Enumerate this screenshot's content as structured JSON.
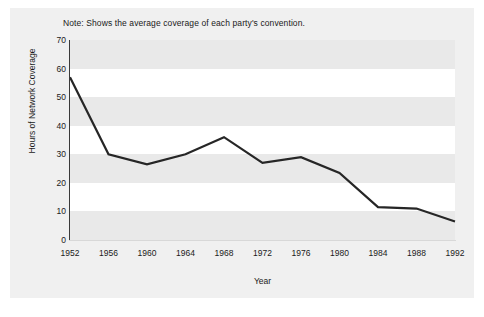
{
  "chart_data": {
    "type": "line",
    "title": "",
    "subtitle": "",
    "note": "Note: Shows the average coverage of each party's convention.",
    "xlabel": "Year",
    "ylabel": "Hours of Network Coverage",
    "x": [
      1952,
      1956,
      1960,
      1964,
      1968,
      1972,
      1976,
      1980,
      1984,
      1988,
      1992
    ],
    "xtick_labels": [
      "1952",
      "1956",
      "1960",
      "1964",
      "1968",
      "1972",
      "1976",
      "1980",
      "1984",
      "1988",
      "1992"
    ],
    "ytick_labels": [
      "0",
      "10",
      "20",
      "30",
      "40",
      "50",
      "60",
      "70"
    ],
    "yticks": [
      0,
      10,
      20,
      30,
      40,
      50,
      60,
      70
    ],
    "ylim": [
      0,
      70
    ],
    "xlim": [
      1952,
      1992
    ],
    "grid": false,
    "banded_background": true,
    "legend": "none",
    "series": [
      {
        "name": "Hours of Network Coverage",
        "color": "#262626",
        "values": [
          57,
          30,
          26.5,
          30,
          36,
          27,
          29,
          23.5,
          11.5,
          11,
          6.5
        ]
      }
    ]
  },
  "colors": {
    "figure_background": "#f0f0f0",
    "plot_background": "#ffffff",
    "band": "#e9e9e9",
    "axis": "#3a3a3a",
    "line": "#262626",
    "text": "#1a1a1a"
  }
}
